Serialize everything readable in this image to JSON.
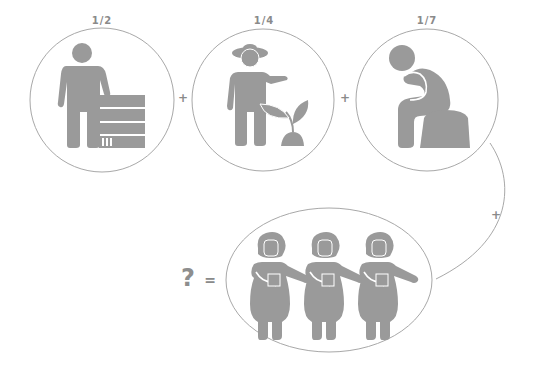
{
  "puzzle": {
    "terms": [
      {
        "fraction": "1/2",
        "icon": "person-with-books-icon"
      },
      {
        "fraction": "1/4",
        "icon": "farmer-with-plant-icon"
      },
      {
        "fraction": "1/7",
        "icon": "thinking-person-sitting-icon"
      }
    ],
    "plus_symbol": "+",
    "equals_symbol": "=",
    "unknown_symbol": "?",
    "result": {
      "count": 3,
      "icon": "woman-figure-icon"
    }
  },
  "colors": {
    "figure": "#9a9a9a",
    "ring": "#a8a8a8",
    "text": "#8a8a8a"
  }
}
